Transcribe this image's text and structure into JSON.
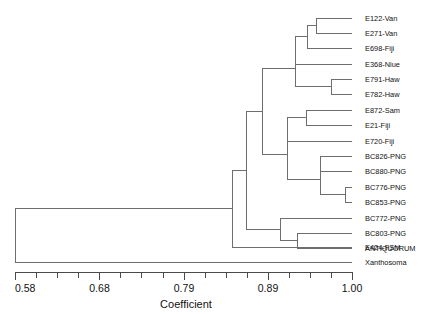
{
  "chart_data": {
    "type": "dendrogram",
    "title": "",
    "xlabel": "Coefficient",
    "ylabel": "",
    "xlim": [
      0.58,
      1.0
    ],
    "grid": false,
    "legend": "none",
    "tick_labels": [
      "0.58",
      "0.68",
      "0.79",
      "0.89",
      "1.00"
    ],
    "tick_values": [
      0.58,
      0.68,
      0.79,
      0.89,
      1.0
    ],
    "minor_ticks_per_interval": 4,
    "leaf_labels": [
      "E122-Van",
      "E271-Van",
      "E698-Fiji",
      "E368-Niue",
      "E791-Haw",
      "E782-Haw",
      "E872-Sam",
      "E21-Fiji",
      "E720-Fiji",
      "BC826-PNG",
      "BC880-PNG",
      "BC776-PNG",
      "BC853-PNG",
      "BC772-PNG",
      "BC803-PNG",
      "ANTIQUORUM",
      "E424-FSM",
      "Xanthosoma"
    ],
    "leaf_tip_coefficient": 1.0,
    "merges": [
      {
        "name": "E122-E271",
        "coefficient": 0.962,
        "members": [
          "E122-Van",
          "E271-Van"
        ]
      },
      {
        "name": "E122-E271-E698",
        "coefficient": 0.951,
        "members": [
          "E122-E271",
          "E698-Fiji"
        ]
      },
      {
        "name": "top4",
        "coefficient": 0.936,
        "members": [
          "E122-E271-E698",
          "E368-Niue"
        ]
      },
      {
        "name": "E791-E782",
        "coefficient": 0.98,
        "members": [
          "E791-Haw",
          "E782-Haw"
        ]
      },
      {
        "name": "top6",
        "coefficient": 0.936,
        "members": [
          "top4",
          "E791-E782"
        ]
      },
      {
        "name": "E872-E21",
        "coefficient": 0.944,
        "members": [
          "E872-Sam",
          "E21-Fiji"
        ]
      },
      {
        "name": "E872-E21-E720",
        "coefficient": 0.915,
        "members": [
          "E872-E21",
          "E720-Fiji"
        ]
      },
      {
        "name": "BC826-BC880",
        "coefficient": 0.968,
        "members": [
          "BC826-PNG",
          "BC880-PNG"
        ]
      },
      {
        "name": "BC776-BC853",
        "coefficient": 0.993,
        "members": [
          "BC776-PNG",
          "BC853-PNG"
        ]
      },
      {
        "name": "png4",
        "coefficient": 0.968,
        "members": [
          "BC826-BC880",
          "BC776-BC853"
        ]
      },
      {
        "name": "midgroup",
        "coefficient": 0.915,
        "members": [
          "E872-E21-E720",
          "png4"
        ]
      },
      {
        "name": "upper",
        "coefficient": 0.894,
        "members": [
          "top6",
          "midgroup"
        ]
      },
      {
        "name": "BC803-ANTIQ",
        "coefficient": 0.918,
        "members": [
          "BC803-PNG",
          "ANTIQUORUM"
        ]
      },
      {
        "name": "lowerPNG",
        "coefficient": 0.867,
        "members": [
          "BC772-PNG",
          "BC803-ANTIQ"
        ]
      },
      {
        "name": "upperAll",
        "coefficient": 0.861,
        "members": [
          "upper",
          "lowerPNG"
        ]
      },
      {
        "name": "withFSM",
        "coefficient": 0.845,
        "members": [
          "upperAll",
          "E424-FSM"
        ]
      },
      {
        "name": "root",
        "coefficient": 0.582,
        "members": [
          "withFSM",
          "Xanthosoma"
        ]
      }
    ]
  },
  "axis": {
    "label": "Coefficient",
    "ticks": [
      "0.58",
      "0.68",
      "0.79",
      "0.89",
      "1.00"
    ]
  },
  "leaves": [
    {
      "label": "E122-Van"
    },
    {
      "label": "E271-Van"
    },
    {
      "label": "E698-Fiji"
    },
    {
      "label": "E368-Niue"
    },
    {
      "label": "E791-Haw"
    },
    {
      "label": "E782-Haw"
    },
    {
      "label": "E872-Sam"
    },
    {
      "label": "E21-Fiji"
    },
    {
      "label": "E720-Fiji"
    },
    {
      "label": "BC826-PNG"
    },
    {
      "label": "BC880-PNG"
    },
    {
      "label": "BC776-PNG"
    },
    {
      "label": "BC853-PNG"
    },
    {
      "label": "BC772-PNG"
    },
    {
      "label": "BC803-PNG"
    },
    {
      "label": "ANTIQUORUM"
    },
    {
      "label": "E424-FSM"
    },
    {
      "label": "Xanthosoma"
    }
  ],
  "colors": {
    "tree_stroke": "#6e6e6e",
    "axis_stroke": "#4a4a4a",
    "text": "#111111",
    "background": "#ffffff"
  }
}
